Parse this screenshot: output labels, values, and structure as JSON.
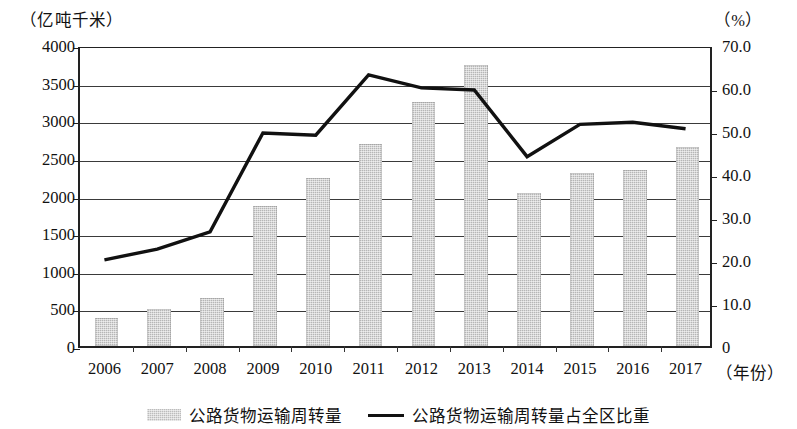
{
  "axes": {
    "left_unit": "（亿吨千米）",
    "right_unit": "（%）",
    "x_title": "（年份）",
    "left_ticks": [
      "4000",
      "3500",
      "3000",
      "2500",
      "2000",
      "1500",
      "1000",
      "500",
      "0"
    ],
    "right_ticks": [
      "70.0",
      "60.0",
      "50.0",
      "40.0",
      "30.0",
      "20.0",
      "10.0",
      "0"
    ]
  },
  "legend": {
    "items": [
      {
        "label": "公路货物运输周转量",
        "marker": "bar-swatch",
        "color": "#bcbcbc"
      },
      {
        "label": "公路货物运输周转量占全区比重",
        "marker": "line-swatch",
        "color": "#111111"
      }
    ]
  },
  "chart_data": {
    "type": "bar",
    "title": "",
    "subtitle": "",
    "xlabel": "（年份）",
    "ylabel": "（亿吨千米）",
    "y2label": "（%）",
    "grid": true,
    "legend_position": "bottom",
    "categories": [
      "2006",
      "2007",
      "2008",
      "2009",
      "2010",
      "2011",
      "2012",
      "2013",
      "2014",
      "2015",
      "2016",
      "2017"
    ],
    "ylim": [
      0,
      4000
    ],
    "ytick_step": 500,
    "y2lim": [
      0,
      70
    ],
    "y2tick_step": 10,
    "series": [
      {
        "name": "公路货物运输周转量",
        "type": "bar",
        "axis": "left",
        "unit": "亿吨千米",
        "color": "#b6b6b6",
        "values": [
          370,
          490,
          640,
          1860,
          2230,
          2680,
          3240,
          3730,
          2040,
          2300,
          2340,
          2650
        ]
      },
      {
        "name": "公路货物运输周转量占全区比重",
        "type": "line",
        "axis": "right",
        "unit": "%",
        "color": "#111111",
        "values": [
          20.5,
          23.0,
          27.0,
          50.0,
          49.5,
          63.5,
          60.5,
          60.0,
          44.5,
          52.0,
          52.5,
          51.0
        ]
      }
    ]
  }
}
